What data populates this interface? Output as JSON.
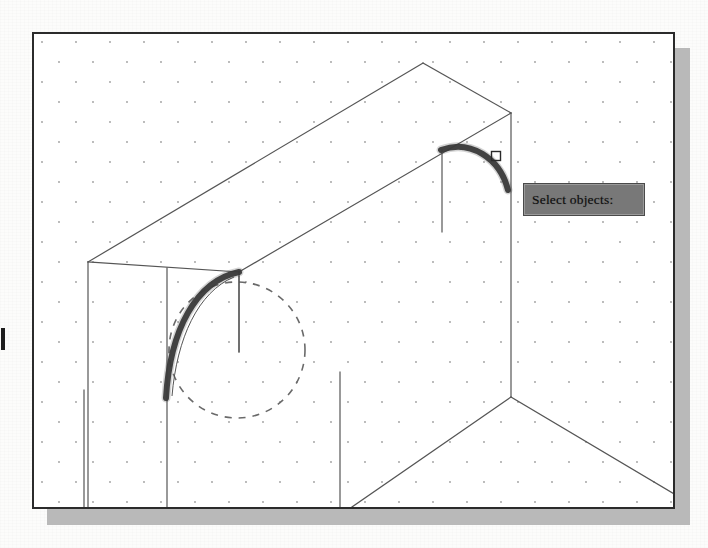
{
  "app": {
    "kind": "cad-drawing-screenshot",
    "tooltip_prompt": "Select objects:"
  },
  "viewport": {
    "background_color": "#ffffff",
    "border_color": "#2b2b2b",
    "shadow_color": "#b9b9b9",
    "x": 32,
    "y": 32,
    "width": 643,
    "height": 477,
    "grid": {
      "type": "staggered-dot-grid",
      "dot_color": "#8c8c8c",
      "spacing_x": 34,
      "spacing_y": 20,
      "stagger_offset_x": 17,
      "dot_radius": 0.9
    }
  },
  "tooltip": {
    "label": "Select objects:",
    "background_color": "#787878",
    "border_color": "#4a4a4a",
    "text_color": "#0f0f0f",
    "x": 521,
    "y": 181,
    "width": 122,
    "height": 33
  },
  "cursor": {
    "type": "pickbox",
    "x": 496,
    "y": 156,
    "size": 9,
    "color": "#2a2a2a"
  },
  "geometry": {
    "line_color": "#555555",
    "highlight_color": "#3a3a3a",
    "dashed_color": "#6a6a6a",
    "model_lines": [
      {
        "name": "top-face-left-edge",
        "x1": 88,
        "y1": 262,
        "x2": 423,
        "y2": 63
      },
      {
        "name": "top-face-top-right-edge",
        "x1": 423,
        "y1": 63,
        "x2": 511,
        "y2": 113
      },
      {
        "name": "top-face-right-edge",
        "x1": 511,
        "y1": 113,
        "x2": 239,
        "y2": 272
      },
      {
        "name": "top-face-bottom-left-edge",
        "x1": 239,
        "y1": 272,
        "x2": 88,
        "y2": 262
      },
      {
        "name": "left-wall-vertical",
        "x1": 88,
        "y1": 262,
        "x2": 88,
        "y2": 507
      },
      {
        "name": "front-corner-vertical",
        "x1": 239,
        "y1": 272,
        "x2": 239,
        "y2": 352
      },
      {
        "name": "right-wall-vertical",
        "x1": 511,
        "y1": 113,
        "x2": 511,
        "y2": 397
      },
      {
        "name": "floor-line-left",
        "x1": 511,
        "y1": 397,
        "x2": 352,
        "y2": 507
      },
      {
        "name": "floor-line-right",
        "x1": 511,
        "y1": 397,
        "x2": 676,
        "y2": 495
      },
      {
        "name": "panel-seam-left",
        "x1": 84,
        "y1": 390,
        "x2": 84,
        "y2": 507
      },
      {
        "name": "panel-seam-mid",
        "x1": 167,
        "y1": 268,
        "x2": 167,
        "y2": 507
      },
      {
        "name": "panel-seam-right",
        "x1": 340,
        "y1": 372,
        "x2": 340,
        "y2": 507
      },
      {
        "name": "extension-line-right",
        "x1": 442,
        "y1": 150,
        "x2": 442,
        "y2": 232
      },
      {
        "name": "extension-line-left",
        "x1": 239,
        "y1": 276,
        "x2": 239,
        "y2": 352
      }
    ],
    "highlighted_arcs": [
      {
        "name": "left-fillet-arc",
        "path": "M 239 272 C 196 281 170 330 166 398",
        "stroke_width": 6
      },
      {
        "name": "right-fillet-arc",
        "path": "M 441 150 C 470 139 500 158 508 190",
        "stroke_width": 6
      }
    ],
    "thin_arcs": [
      {
        "name": "left-fillet-arc-thin",
        "path": "M 234 277 C 198 292 177 338 172 396",
        "stroke_width": 1
      }
    ],
    "dashed_circle": {
      "name": "hidden-cylinder-circle",
      "cx": 237,
      "cy": 350,
      "r": 68,
      "dash": "7 7"
    }
  },
  "left_edge_mark": {
    "name": "page-edge-tick",
    "color": "#1d1d1d",
    "x": 1,
    "y": 328,
    "width": 4,
    "height": 22
  }
}
